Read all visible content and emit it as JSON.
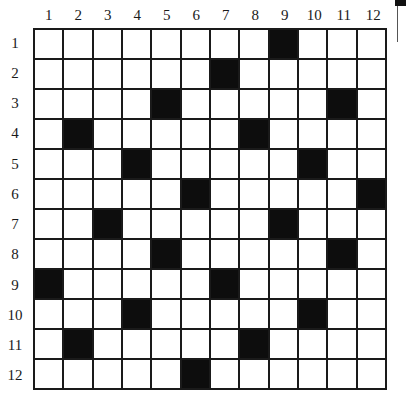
{
  "puzzle": {
    "rows": 12,
    "cols": 12,
    "column_labels": [
      "1",
      "2",
      "3",
      "4",
      "5",
      "6",
      "7",
      "8",
      "9",
      "10",
      "11",
      "12"
    ],
    "row_labels": [
      "1",
      "2",
      "3",
      "4",
      "5",
      "6",
      "7",
      "8",
      "9",
      "10",
      "11",
      "12"
    ],
    "black_cells": [
      [
        1,
        9
      ],
      [
        2,
        7
      ],
      [
        3,
        5
      ],
      [
        3,
        11
      ],
      [
        4,
        2
      ],
      [
        4,
        8
      ],
      [
        5,
        4
      ],
      [
        5,
        10
      ],
      [
        6,
        6
      ],
      [
        6,
        12
      ],
      [
        7,
        3
      ],
      [
        7,
        9
      ],
      [
        8,
        5
      ],
      [
        8,
        11
      ],
      [
        9,
        1
      ],
      [
        9,
        7
      ],
      [
        10,
        4
      ],
      [
        10,
        10
      ],
      [
        11,
        2
      ],
      [
        11,
        8
      ],
      [
        12,
        6
      ]
    ],
    "colors": {
      "line": "#1a1a1a",
      "black_cell": "#0d0d0d",
      "white_cell": "#ffffff"
    }
  }
}
